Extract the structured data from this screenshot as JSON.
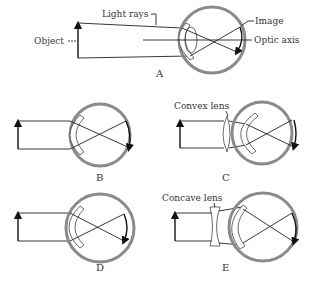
{
  "diagram": {
    "colors": {
      "background": "#ffffff",
      "ink": "#222222",
      "eyeball": "#8a8a8a"
    },
    "panels": [
      {
        "id": "A",
        "label": "A",
        "annotations": {
          "light_rays": "Light rays",
          "object": "Object",
          "image": "Image",
          "optic_axis": "Optic axis"
        }
      },
      {
        "id": "B",
        "label": "B"
      },
      {
        "id": "C",
        "label": "C",
        "annotations": {
          "lens": "Convex lens"
        }
      },
      {
        "id": "D",
        "label": "D"
      },
      {
        "id": "E",
        "label": "E",
        "annotations": {
          "lens": "Concave lens"
        }
      }
    ]
  }
}
